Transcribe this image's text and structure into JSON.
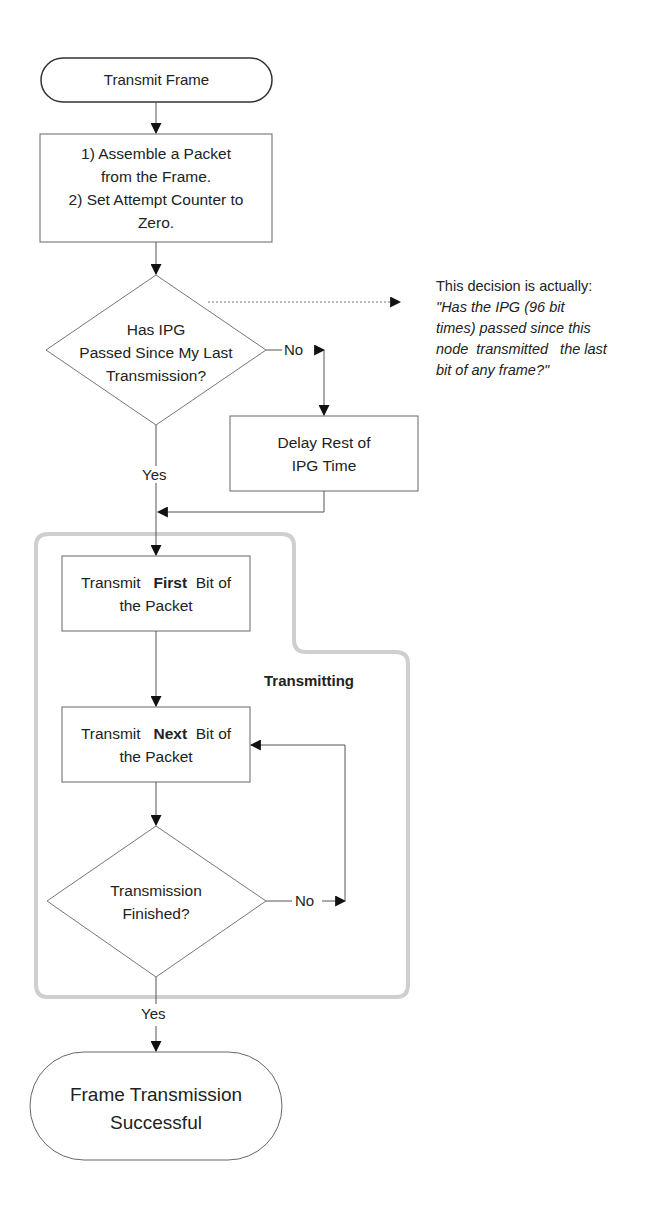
{
  "diagram": {
    "type": "flowchart",
    "nodes": {
      "start": {
        "shape": "terminal",
        "label": "Transmit Frame"
      },
      "assemble": {
        "shape": "process",
        "lines": [
          "1) Assemble a Packet",
          "from the Frame.",
          "2) Set Attempt Counter to",
          "Zero."
        ]
      },
      "ipg_decision": {
        "shape": "decision",
        "lines": [
          "Has IPG",
          "Passed Since My Last",
          "Transmission?"
        ]
      },
      "delay": {
        "shape": "process",
        "lines": [
          "Delay Rest of",
          "IPG Time"
        ]
      },
      "first_bit": {
        "shape": "process",
        "prefix": "Transmit",
        "bold": "First",
        "suffix": "Bit of",
        "line2": "the Packet"
      },
      "next_bit": {
        "shape": "process",
        "prefix": "Transmit",
        "bold": "Next",
        "suffix": "Bit of",
        "line2": "the Packet"
      },
      "finished_decision": {
        "shape": "decision",
        "lines": [
          "Transmission",
          "Finished?"
        ]
      },
      "end": {
        "shape": "terminal",
        "lines": [
          "Frame Transmission",
          "Successful"
        ]
      }
    },
    "edge_labels": {
      "ipg_no": "No",
      "ipg_yes": "Yes",
      "finished_no": "No",
      "finished_yes": "Yes"
    },
    "group": {
      "label": "Transmitting"
    },
    "annotation": {
      "intro": "This decision is actually:",
      "lines": [
        "\"Has the IPG (96 bit",
        "times) passed since this",
        "node  transmitted   the last",
        "bit of any frame?\""
      ]
    },
    "colors": {
      "stroke": "#555555",
      "arrow": "#111111",
      "group_outline": "#c8c8c8",
      "text": "#222222"
    }
  }
}
